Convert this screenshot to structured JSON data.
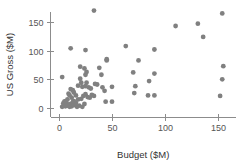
{
  "chart_data": {
    "type": "scatter",
    "title": "",
    "xlabel": "Budget ($M)",
    "ylabel": "US Gross ($M)",
    "xlim": [
      -8,
      165
    ],
    "ylim": [
      -12,
      178
    ],
    "xticks": [
      0,
      50,
      100,
      150
    ],
    "yticks": [
      0,
      50,
      100,
      150
    ],
    "xtick_labels": [
      "0",
      "50",
      "100",
      "150"
    ],
    "ytick_labels": [
      "0",
      "50",
      "100",
      "150"
    ],
    "grid": false,
    "legend": null,
    "marker": {
      "shape": "circle",
      "color": "#808080",
      "radius_px": 2.4
    },
    "points": [
      {
        "x": 3,
        "y": 54
      },
      {
        "x": 11,
        "y": 104
      },
      {
        "x": 20,
        "y": 72
      },
      {
        "x": 25,
        "y": 101
      },
      {
        "x": 24,
        "y": 69
      },
      {
        "x": 26,
        "y": 63
      },
      {
        "x": 25,
        "y": 58
      },
      {
        "x": 33,
        "y": 170
      },
      {
        "x": 38,
        "y": 70
      },
      {
        "x": 45,
        "y": 85
      },
      {
        "x": 45,
        "y": 83
      },
      {
        "x": 40,
        "y": 58
      },
      {
        "x": 63,
        "y": 108
      },
      {
        "x": 70,
        "y": 62
      },
      {
        "x": 75,
        "y": 83
      },
      {
        "x": 90,
        "y": 102
      },
      {
        "x": 90,
        "y": 60
      },
      {
        "x": 85,
        "y": 47
      },
      {
        "x": 72,
        "y": 38
      },
      {
        "x": 71,
        "y": 26
      },
      {
        "x": 84,
        "y": 22
      },
      {
        "x": 90,
        "y": 22
      },
      {
        "x": 110,
        "y": 143
      },
      {
        "x": 131,
        "y": 147
      },
      {
        "x": 136,
        "y": 124
      },
      {
        "x": 154,
        "y": 165
      },
      {
        "x": 155,
        "y": 73
      },
      {
        "x": 154,
        "y": 50
      },
      {
        "x": 152,
        "y": 21
      },
      {
        "x": 20,
        "y": 51
      },
      {
        "x": 21,
        "y": 44
      },
      {
        "x": 18,
        "y": 39
      },
      {
        "x": 22,
        "y": 37
      },
      {
        "x": 26,
        "y": 44
      },
      {
        "x": 25,
        "y": 38
      },
      {
        "x": 28,
        "y": 36
      },
      {
        "x": 30,
        "y": 34
      },
      {
        "x": 34,
        "y": 42
      },
      {
        "x": 36,
        "y": 41
      },
      {
        "x": 41,
        "y": 36
      },
      {
        "x": 43,
        "y": 30
      },
      {
        "x": 50,
        "y": 37
      },
      {
        "x": 11,
        "y": 33
      },
      {
        "x": 13,
        "y": 31
      },
      {
        "x": 9,
        "y": 25
      },
      {
        "x": 10,
        "y": 22
      },
      {
        "x": 12,
        "y": 18
      },
      {
        "x": 14,
        "y": 27
      },
      {
        "x": 16,
        "y": 22
      },
      {
        "x": 18,
        "y": 15
      },
      {
        "x": 21,
        "y": 16
      },
      {
        "x": 23,
        "y": 21
      },
      {
        "x": 25,
        "y": 24
      },
      {
        "x": 27,
        "y": 19
      },
      {
        "x": 29,
        "y": 18
      },
      {
        "x": 31,
        "y": 23
      },
      {
        "x": 33,
        "y": 21
      },
      {
        "x": 44,
        "y": 11
      },
      {
        "x": 50,
        "y": 11
      },
      {
        "x": 4,
        "y": 8
      },
      {
        "x": 5,
        "y": 5
      },
      {
        "x": 6,
        "y": 3
      },
      {
        "x": 7,
        "y": 9
      },
      {
        "x": 8,
        "y": 4
      },
      {
        "x": 9,
        "y": 6
      },
      {
        "x": 10,
        "y": 2
      },
      {
        "x": 11,
        "y": 7
      },
      {
        "x": 12,
        "y": 3
      },
      {
        "x": 13,
        "y": 10
      },
      {
        "x": 15,
        "y": 5
      },
      {
        "x": 17,
        "y": 2
      },
      {
        "x": 19,
        "y": 4
      },
      {
        "x": 22,
        "y": 2
      },
      {
        "x": 24,
        "y": 7
      },
      {
        "x": 6,
        "y": 12
      },
      {
        "x": 8,
        "y": 15
      },
      {
        "x": 14,
        "y": 12
      },
      {
        "x": 16,
        "y": 9
      },
      {
        "x": 3,
        "y": 2
      },
      {
        "x": 5,
        "y": 11
      }
    ]
  }
}
